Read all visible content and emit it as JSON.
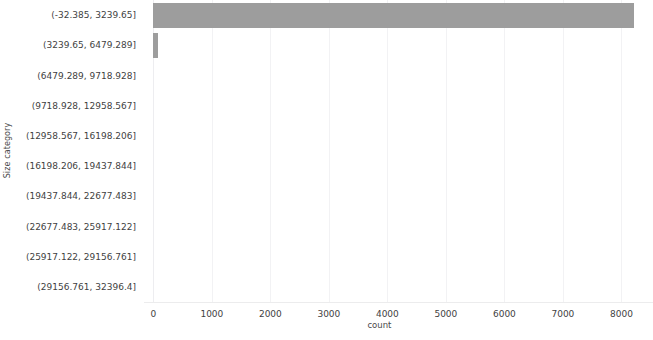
{
  "chart_data": {
    "type": "bar",
    "orientation": "horizontal",
    "title": "",
    "xlabel": "count",
    "ylabel": "Size category",
    "categories": [
      "(-32.385, 3239.65]",
      "(3239.65, 6479.289]",
      "(6479.289, 9718.928]",
      "(9718.928, 12958.567]",
      "(12958.567, 16198.206]",
      "(16198.206, 19437.844]",
      "(19437.844, 22677.483]",
      "(22677.483, 25917.122]",
      "(25917.122, 29156.761]",
      "(29156.761, 32396.4]"
    ],
    "values": [
      8220,
      85,
      0,
      0,
      0,
      0,
      0,
      0,
      0,
      0
    ],
    "xlim": [
      -160,
      8540
    ],
    "xticks": [
      0,
      1000,
      2000,
      3000,
      4000,
      5000,
      6000,
      7000,
      8000
    ],
    "xtick_labels": [
      "0",
      "1000",
      "2000",
      "3000",
      "4000",
      "5000",
      "6000",
      "7000",
      "8000"
    ],
    "grid": true,
    "grid_axis": "x",
    "legend": false,
    "bar_color": "#9d9d9d",
    "grid_color": "#f2f2f4",
    "background": "#ffffff",
    "text_color": "#3f3f3f"
  }
}
